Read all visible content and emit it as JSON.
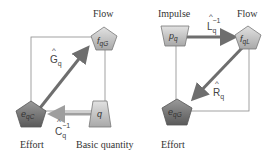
{
  "left_diagram": {
    "labels": {
      "flow": "Flow",
      "effort": "Effort",
      "basic_quantity": "Basic quantity"
    },
    "nodes": {
      "flow_node": {
        "main": "f",
        "sub": "qG",
        "shape": "pentagon"
      },
      "effort_node": {
        "main": "e",
        "sub": "qC",
        "shape": "pentagon"
      },
      "quantity_node": {
        "main": "q",
        "sub": "",
        "shape": "trapezoid"
      }
    },
    "operators": {
      "G": {
        "main": "G",
        "sub": "q",
        "sup": "",
        "hat": "^"
      },
      "C": {
        "main": "C",
        "sub": "q",
        "sup": "−1",
        "hat": "^"
      }
    }
  },
  "right_diagram": {
    "labels": {
      "impulse": "Impulse",
      "flow": "Flow",
      "effort": "Effort"
    },
    "nodes": {
      "impulse_node": {
        "main": "p",
        "sub": "q",
        "shape": "inverted-trapezoid"
      },
      "flow_node": {
        "main": "f",
        "sub": "qL",
        "shape": "pentagon"
      },
      "effort_node": {
        "main": "e",
        "sub": "qG",
        "shape": "pentagon"
      }
    },
    "operators": {
      "L": {
        "main": "L",
        "sub": "q",
        "sup": "−1",
        "hat": "^"
      },
      "R": {
        "main": "R",
        "sub": "q",
        "sup": "",
        "hat": "^"
      }
    }
  },
  "colors": {
    "node_light": "#c8c8c8",
    "node_dark": "#7a7a7a",
    "arrow": "#7b7b7b",
    "arrow_light": "#a9a9a9",
    "frame": "#8a8a8a"
  }
}
